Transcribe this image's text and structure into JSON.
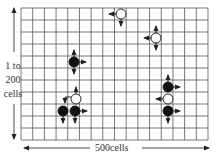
{
  "diagram": {
    "type": "grid-lattice",
    "grid": {
      "left": 21,
      "top": 8,
      "right": 208,
      "bottom": 140,
      "columns": 16,
      "rows": 11,
      "line_color": "#555555"
    },
    "vertical_axis": {
      "label_lines": [
        "1 to",
        "200",
        "cells"
      ]
    },
    "horizontal_axis": {
      "label": "500cells"
    },
    "colors": {
      "black_piece": "#111111",
      "white_piece": "#ffffff",
      "arrow": "#222222"
    },
    "pieces": [
      {
        "id": "white-1",
        "color": "white",
        "cx": 121,
        "cy": 14,
        "arrows": [
          "left",
          "down"
        ]
      },
      {
        "id": "white-2",
        "color": "white",
        "cx": 156,
        "cy": 38,
        "arrows": [
          "left",
          "up",
          "down"
        ]
      },
      {
        "id": "black-1",
        "color": "black",
        "cx": 74,
        "cy": 62,
        "arrows": [
          "up",
          "down",
          "right"
        ]
      },
      {
        "id": "white-3",
        "color": "white",
        "cx": 76,
        "cy": 99,
        "arrows": [
          "up",
          "left-bent"
        ]
      },
      {
        "id": "black-2",
        "color": "black",
        "cx": 63,
        "cy": 111,
        "arrows": [
          "down"
        ]
      },
      {
        "id": "black-3",
        "color": "black",
        "cx": 75,
        "cy": 111,
        "arrows": [
          "right",
          "down"
        ]
      },
      {
        "id": "black-4",
        "color": "black",
        "cx": 168,
        "cy": 87,
        "arrows": [
          "up",
          "right"
        ]
      },
      {
        "id": "white-4",
        "color": "white",
        "cx": 168,
        "cy": 99,
        "arrows": [
          "left"
        ]
      },
      {
        "id": "black-5",
        "color": "black",
        "cx": 168,
        "cy": 111,
        "arrows": [
          "right",
          "down"
        ]
      }
    ]
  }
}
